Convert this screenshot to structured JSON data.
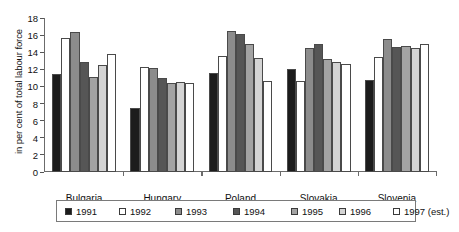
{
  "chart_data": {
    "type": "bar",
    "title": "",
    "subtitle": "",
    "xlabel": "",
    "ylabel": "in per cent of total labour force",
    "ylim": [
      0,
      18
    ],
    "yticks": [
      0,
      2,
      4,
      6,
      8,
      10,
      12,
      14,
      16,
      18
    ],
    "grid": false,
    "legend_position": "bottom",
    "categories": [
      "Bulgaria",
      "Hungary",
      "Poland",
      "Slovakia",
      "Slovenia"
    ],
    "series": [
      {
        "name": "1991",
        "color": "#1c1c1c",
        "values": [
          11.5,
          7.5,
          11.6,
          12.0,
          10.7
        ]
      },
      {
        "name": "1992",
        "color": "#ffffff",
        "values": [
          15.7,
          12.3,
          13.6,
          10.6,
          13.4
        ]
      },
      {
        "name": "1993",
        "color": "#8c8c8c",
        "values": [
          16.4,
          12.1,
          16.5,
          14.5,
          15.6
        ]
      },
      {
        "name": "1994",
        "color": "#565656",
        "values": [
          12.9,
          11.0,
          16.1,
          15.0,
          14.6
        ]
      },
      {
        "name": "1995",
        "color": "#a3a3a3",
        "values": [
          11.1,
          10.4,
          15.0,
          13.2,
          14.7
        ]
      },
      {
        "name": "1996",
        "color": "#d4d4d4",
        "values": [
          12.5,
          10.5,
          13.3,
          12.9,
          14.5
        ]
      },
      {
        "name": "1997 (est.)",
        "color": "#ffffff",
        "values": [
          13.8,
          10.4,
          10.6,
          12.6,
          15.0
        ]
      }
    ]
  },
  "legend": {
    "entries": [
      {
        "label": "1991"
      },
      {
        "label": "1992"
      },
      {
        "label": "1993"
      },
      {
        "label": "1994"
      },
      {
        "label": "1995"
      },
      {
        "label": "1996"
      },
      {
        "label": "1997 (est.)"
      }
    ]
  }
}
